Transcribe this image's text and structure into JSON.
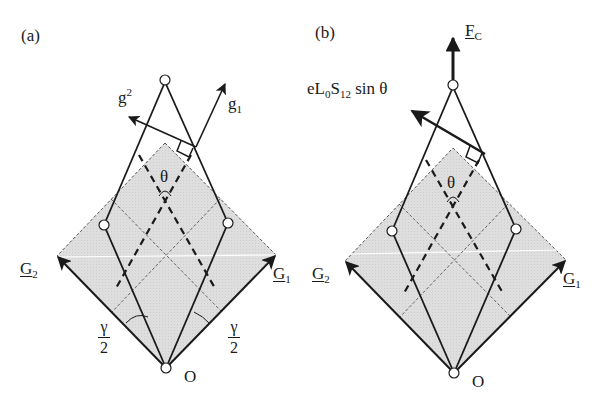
{
  "figure": {
    "panels": [
      {
        "id": "a",
        "label": "(a)",
        "vectors": {
          "g_upper": {
            "base": "g",
            "sup": "2"
          },
          "g_lower": {
            "base": "g",
            "sub": "1"
          },
          "G2": {
            "base": "G",
            "sub": "2"
          },
          "G1": {
            "base": "G",
            "sub": "1"
          }
        },
        "angle_label": "θ",
        "half_angle_left": {
          "num": "γ",
          "den": "2"
        },
        "half_angle_right": {
          "num": "γ",
          "den": "2"
        },
        "origin_label": "O"
      },
      {
        "id": "b",
        "label": "(b)",
        "force": {
          "base": "F",
          "sub": "C"
        },
        "moment_label": {
          "e": "eL",
          "sub0": "0",
          "S": "S",
          "sub12": "12",
          "tail": " sin θ"
        },
        "vectors": {
          "G2": {
            "base": "G",
            "sub": "2"
          },
          "G1": {
            "base": "G",
            "sub": "1"
          }
        },
        "angle_label": "θ",
        "origin_label": "O"
      }
    ],
    "colors": {
      "stroke": "#1a1a1a",
      "fill_region": "#dcdcdc",
      "dashed_frame": "#555555",
      "background": "#ffffff"
    }
  }
}
